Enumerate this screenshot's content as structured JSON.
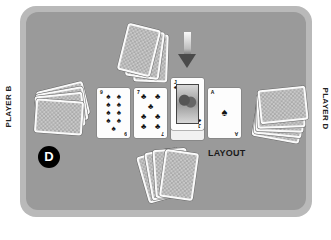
{
  "table": {
    "felt_color": "#9a9a9a",
    "border_color": "#b9b9b9",
    "background_color": "#ffffff"
  },
  "labels": {
    "player_left": "PLAYER B",
    "player_right": "PLAYER D",
    "layout": "LAYOUT",
    "dealer_button": "D"
  },
  "hands": {
    "top": {
      "position": "top",
      "face_down_count": 3
    },
    "left": {
      "position": "left",
      "face_down_count": 4
    },
    "right": {
      "position": "right",
      "face_down_count": 5
    },
    "bottom": {
      "position": "bottom",
      "face_down_count": 4
    }
  },
  "layout_cards": [
    {
      "rank": "9",
      "suit": "spades",
      "suit_symbol": "♠"
    },
    {
      "rank": "7",
      "suit": "clubs",
      "suit_symbol": "♣"
    },
    {
      "rank": "J",
      "suit": "clubs",
      "suit_symbol": "♣",
      "highlighted": true
    },
    {
      "rank": "A",
      "suit": "spades",
      "suit_symbol": "♠"
    }
  ],
  "indicator": {
    "icon": "down-arrow-icon",
    "target_card_index": 2
  }
}
